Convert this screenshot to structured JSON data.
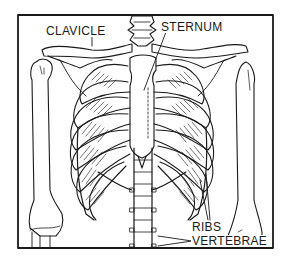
{
  "diagram": {
    "line_color": "#1a1a1a",
    "background": "#ffffff",
    "labels": {
      "clavicle": "CLAVICLE",
      "sternum": "STERNUM",
      "ribs": "RIBS",
      "vertebrae": "VERTEBRAE"
    }
  }
}
